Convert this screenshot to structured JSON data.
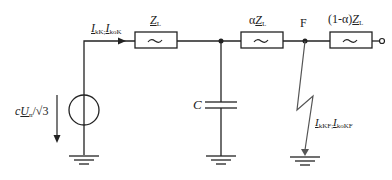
{
  "diagram": {
    "type": "equivalent-circuit",
    "elements": {
      "source_label_prefix": "c",
      "source_label_var": "U",
      "source_label_sub": "n",
      "source_label_suffix": "/√3",
      "current_main_1_var": "I",
      "current_main_1_sub": "kK",
      "current_sep": ";",
      "current_main_2_var": "I",
      "current_main_2_sub": "koK",
      "z1_var": "Z",
      "z1_sub": "L",
      "z2_prefix": "α",
      "z2_var": "Z",
      "z2_sub": "L",
      "z3_prefix": "(1-α)",
      "z3_var": "Z",
      "z3_sub": "L",
      "capacitor_label": "C",
      "fault_node_label": "F",
      "fault_current_1_var": "I",
      "fault_current_1_sub": "kKF",
      "fault_current_2_var": "I",
      "fault_current_2_sub": "koKF",
      "impedance_symbol": "~"
    },
    "colors": {
      "line": "#222222",
      "fault_line": "#555555",
      "background": "#ffffff"
    }
  }
}
